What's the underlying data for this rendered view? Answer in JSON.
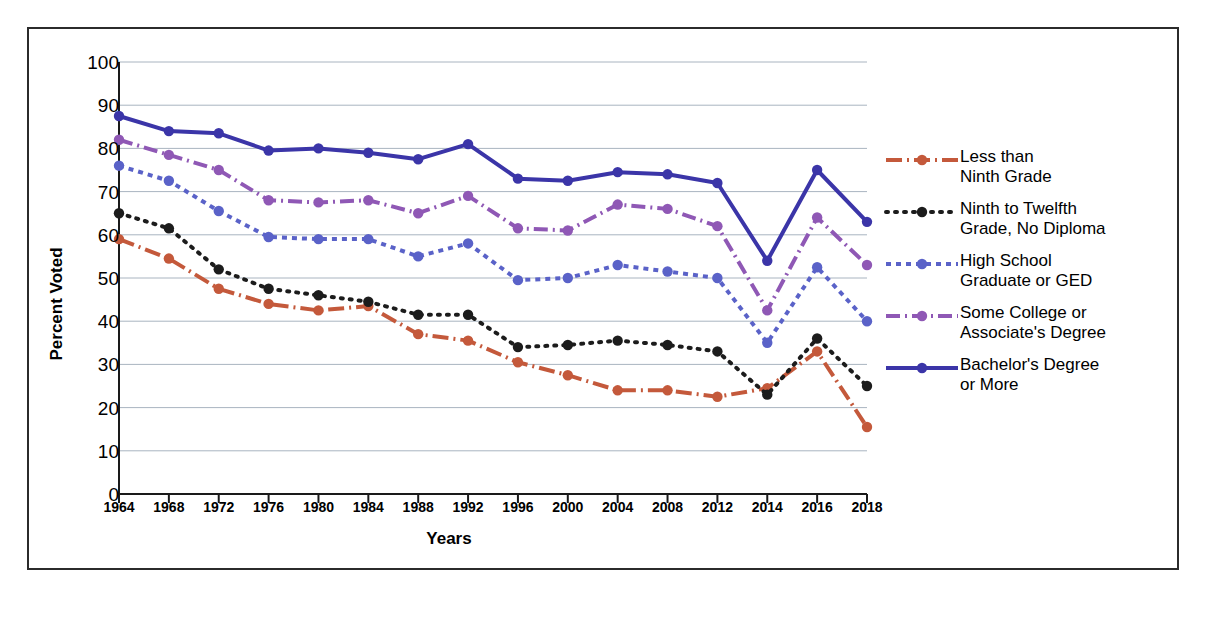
{
  "axes": {
    "ylabel": "Percent Voted",
    "xlabel": "Years",
    "yticks": [
      "100",
      "90",
      "80",
      "70",
      "60",
      "50",
      "40",
      "30",
      "20",
      "10",
      "0"
    ]
  },
  "legend": {
    "items": [
      {
        "label_line1": "Less than",
        "label_line2": "Ninth Grade",
        "color": "#c4593b",
        "style": "dash-dot-fine"
      },
      {
        "label_line1": "Ninth to Twelfth",
        "label_line2": "Grade, No Diploma",
        "color": "#1c1c1c",
        "style": "dotted"
      },
      {
        "label_line1": "High School",
        "label_line2": "Graduate or GED",
        "color": "#5a62c8",
        "style": "square-dotted"
      },
      {
        "label_line1": "Some College or",
        "label_line2": "Associate's Degree",
        "color": "#8f58b5",
        "style": "dash-dot"
      },
      {
        "label_line1": "Bachelor's Degree",
        "label_line2": "or More",
        "color": "#3b35a8",
        "style": "solid"
      }
    ]
  },
  "chart_data": {
    "type": "line",
    "title": "",
    "xlabel": "Years",
    "ylabel": "Percent Voted",
    "ylim": [
      0,
      100
    ],
    "grid": true,
    "legend_position": "right",
    "categories": [
      "1964",
      "1968",
      "1972",
      "1976",
      "1980",
      "1984",
      "1988",
      "1992",
      "1996",
      "2000",
      "2004",
      "2008",
      "2012",
      "2014",
      "2016",
      "2018"
    ],
    "series": [
      {
        "name": "Less than Ninth Grade",
        "color": "#c4593b",
        "values": [
          59.0,
          54.5,
          47.5,
          44.0,
          42.5,
          43.5,
          37.0,
          35.5,
          30.5,
          27.5,
          24.0,
          24.0,
          22.5,
          24.5,
          33.0,
          15.5
        ]
      },
      {
        "name": "Ninth to Twelfth Grade, No Diploma",
        "color": "#1c1c1c",
        "values": [
          65.0,
          61.5,
          52.0,
          47.5,
          46.0,
          44.5,
          41.5,
          41.5,
          34.0,
          34.5,
          35.5,
          34.5,
          33.0,
          23.0,
          36.0,
          25.0
        ]
      },
      {
        "name": "High School Graduate or GED",
        "color": "#5a62c8",
        "values": [
          76.0,
          72.5,
          65.5,
          59.5,
          59.0,
          59.0,
          55.0,
          58.0,
          49.5,
          50.0,
          53.0,
          51.5,
          50.0,
          35.0,
          52.5,
          40.0
        ]
      },
      {
        "name": "Some College or Associate's Degree",
        "color": "#8f58b5",
        "values": [
          82.0,
          78.5,
          75.0,
          68.0,
          67.5,
          68.0,
          65.0,
          69.0,
          61.5,
          61.0,
          67.0,
          66.0,
          62.0,
          42.5,
          64.0,
          53.0
        ]
      },
      {
        "name": "Bachelor's Degree or More",
        "color": "#3b35a8",
        "values": [
          87.5,
          84.0,
          83.5,
          79.5,
          80.0,
          79.0,
          77.5,
          81.0,
          73.0,
          72.5,
          74.5,
          74.0,
          72.0,
          54.0,
          75.0,
          63.0
        ]
      }
    ]
  }
}
